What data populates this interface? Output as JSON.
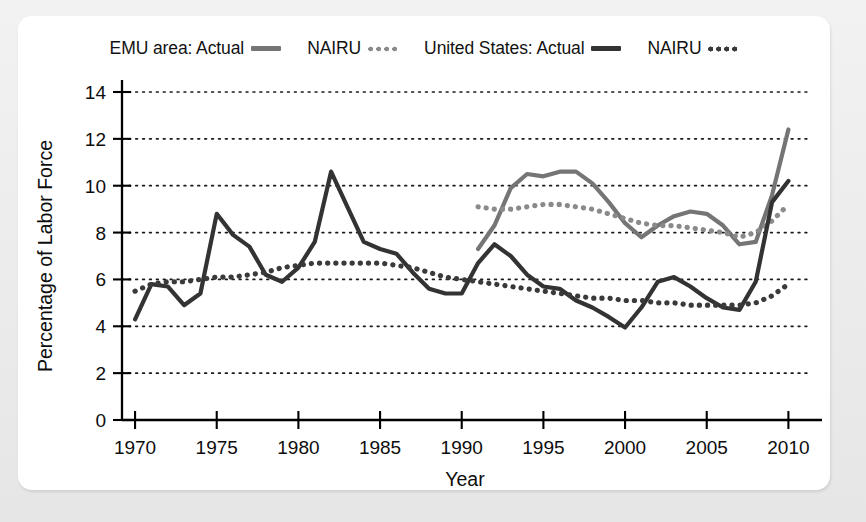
{
  "legend": {
    "items": [
      {
        "name": "emu-actual",
        "label": "EMU area: Actual",
        "style": "solid",
        "color": "#757575"
      },
      {
        "name": "emu-nairu",
        "label": "NAIRU",
        "style": "dotted",
        "color": "#8a8a8a"
      },
      {
        "name": "us-actual",
        "label": "United States: Actual",
        "style": "solid",
        "color": "#333333"
      },
      {
        "name": "us-nairu",
        "label": "NAIRU",
        "style": "dotted",
        "color": "#3a3a3a"
      }
    ]
  },
  "chart_data": {
    "type": "line",
    "title": "",
    "xlabel": "Year",
    "ylabel": "Percentage of Labor Force",
    "xlim": [
      1969.2,
      2011.2
    ],
    "ylim": [
      0,
      14
    ],
    "xticks": [
      1970,
      1975,
      1980,
      1985,
      1990,
      1995,
      2000,
      2005,
      2010
    ],
    "yticks": [
      0,
      2,
      4,
      6,
      8,
      10,
      12,
      14
    ],
    "grid": "horizontal-dotted",
    "legend_position": "top-center",
    "series": [
      {
        "name": "EMU area: Actual",
        "key": "emu_actual",
        "style": "solid",
        "color": "#757575",
        "width": 4.2,
        "x": [
          1991,
          1992,
          1993,
          1994,
          1995,
          1996,
          1997,
          1998,
          1999,
          2000,
          2001,
          2002,
          2003,
          2004,
          2005,
          2006,
          2007,
          2008,
          2009,
          2010
        ],
        "values": [
          7.3,
          8.3,
          9.9,
          10.5,
          10.4,
          10.6,
          10.6,
          10.1,
          9.3,
          8.4,
          7.8,
          8.3,
          8.7,
          8.9,
          8.8,
          8.3,
          7.5,
          7.6,
          9.6,
          12.4
        ]
      },
      {
        "name": "EMU area: NAIRU",
        "key": "emu_nairu",
        "style": "dotted",
        "color": "#8a8a8a",
        "width": 5.2,
        "x": [
          1991,
          1992,
          1993,
          1994,
          1995,
          1996,
          1997,
          1998,
          1999,
          2000,
          2001,
          2002,
          2003,
          2004,
          2005,
          2006,
          2007,
          2008,
          2009,
          2010
        ],
        "values": [
          9.1,
          9.0,
          9.0,
          9.1,
          9.2,
          9.2,
          9.1,
          9.0,
          8.8,
          8.6,
          8.4,
          8.3,
          8.3,
          8.2,
          8.1,
          8.0,
          7.8,
          8.0,
          8.5,
          9.2
        ]
      },
      {
        "name": "United States: Actual",
        "key": "us_actual",
        "style": "solid",
        "color": "#333333",
        "width": 4.2,
        "x": [
          1970,
          1971,
          1972,
          1973,
          1974,
          1975,
          1976,
          1977,
          1978,
          1979,
          1980,
          1981,
          1982,
          1983,
          1984,
          1985,
          1986,
          1987,
          1988,
          1989,
          1990,
          1991,
          1992,
          1993,
          1994,
          1995,
          1996,
          1997,
          1998,
          1999,
          2000,
          2001,
          2002,
          2003,
          2004,
          2005,
          2006,
          2007,
          2008,
          2009,
          2010
        ],
        "values": [
          4.3,
          5.8,
          5.7,
          4.9,
          5.4,
          8.8,
          7.9,
          7.4,
          6.2,
          5.9,
          6.5,
          7.6,
          10.6,
          9.1,
          7.6,
          7.3,
          7.1,
          6.3,
          5.6,
          5.4,
          5.4,
          6.7,
          7.5,
          7.0,
          6.2,
          5.7,
          5.6,
          5.1,
          4.8,
          4.4,
          3.95,
          4.8,
          5.9,
          6.1,
          5.7,
          5.2,
          4.8,
          4.7,
          5.9,
          9.3,
          10.2
        ]
      },
      {
        "name": "United States: NAIRU",
        "key": "us_nairu",
        "style": "dotted",
        "color": "#3a3a3a",
        "width": 5.2,
        "x": [
          1970,
          1971,
          1972,
          1973,
          1974,
          1975,
          1976,
          1977,
          1978,
          1979,
          1980,
          1981,
          1982,
          1983,
          1984,
          1985,
          1986,
          1987,
          1988,
          1989,
          1990,
          1991,
          1992,
          1993,
          1994,
          1995,
          1996,
          1997,
          1998,
          1999,
          2000,
          2001,
          2002,
          2003,
          2004,
          2005,
          2006,
          2007,
          2008,
          2009,
          2010
        ],
        "values": [
          5.5,
          5.8,
          5.9,
          5.9,
          6.0,
          6.1,
          6.1,
          6.2,
          6.3,
          6.5,
          6.6,
          6.7,
          6.7,
          6.7,
          6.7,
          6.7,
          6.6,
          6.5,
          6.3,
          6.1,
          6.0,
          5.9,
          5.8,
          5.7,
          5.6,
          5.5,
          5.4,
          5.3,
          5.2,
          5.2,
          5.1,
          5.1,
          5.0,
          5.0,
          4.9,
          4.9,
          4.9,
          4.9,
          5.0,
          5.3,
          5.8
        ]
      }
    ]
  }
}
